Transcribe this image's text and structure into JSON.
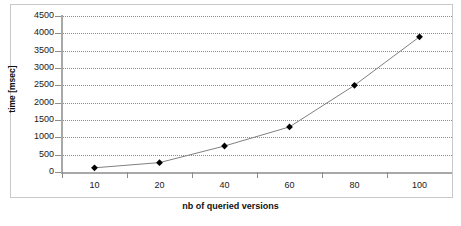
{
  "chart_data": {
    "type": "line",
    "title": "",
    "subtitle": "",
    "xlabel": "nb of queried versions",
    "ylabel": "time [msec]",
    "categories": [
      "10",
      "20",
      "40",
      "60",
      "80",
      "100"
    ],
    "x": [
      10,
      20,
      40,
      60,
      80,
      100
    ],
    "values": [
      120,
      270,
      750,
      1300,
      2500,
      3900
    ],
    "series": [
      {
        "name": "time",
        "values": [
          120,
          270,
          750,
          1300,
          2500,
          3900
        ],
        "marker": "diamond",
        "marker_color": "#000000",
        "line_color": "#808080"
      }
    ],
    "ylim": [
      0,
      4500
    ],
    "y_ticks": [
      0,
      500,
      1000,
      1500,
      2000,
      2500,
      3000,
      3500,
      4000,
      4500
    ],
    "y_tick_labels": [
      "0",
      "500",
      "1000",
      "1500",
      "2000",
      "2500",
      "3000",
      "3500",
      "4000",
      "4500"
    ],
    "x_tick_labels": [
      "10",
      "20",
      "40",
      "60",
      "80",
      "100"
    ],
    "grid": {
      "horizontal": true,
      "vertical": false,
      "style": "dotted",
      "color": "#8d8d8d"
    },
    "legend": {
      "visible": false,
      "position": "none",
      "entries": []
    },
    "axis_color": "#a8a8a8",
    "background": "#ffffff",
    "border": "#c9c9c9",
    "annotations": []
  },
  "axes": {
    "y_title": "time [msec]",
    "x_title": "nb of queried versions"
  }
}
